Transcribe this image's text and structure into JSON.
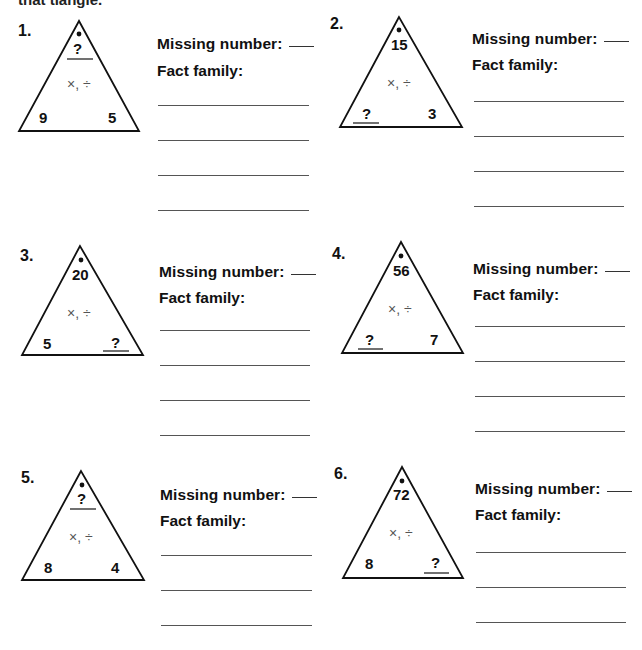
{
  "header": {
    "partial_text": "that tiangle."
  },
  "labels": {
    "missing_number": "Missing number:",
    "fact_family": "Fact family:"
  },
  "operations_symbol": "×, ÷",
  "problems": [
    {
      "number": "1.",
      "top": "?",
      "bottom_left": "9",
      "bottom_right": "5",
      "missing": "top"
    },
    {
      "number": "2.",
      "top": "15",
      "bottom_left": "?",
      "bottom_right": "3",
      "missing": "bottom_left"
    },
    {
      "number": "3.",
      "top": "20",
      "bottom_left": "5",
      "bottom_right": "?",
      "missing": "bottom_right"
    },
    {
      "number": "4.",
      "top": "56",
      "bottom_left": "?",
      "bottom_right": "7",
      "missing": "bottom_left"
    },
    {
      "number": "5.",
      "top": "?",
      "bottom_left": "8",
      "bottom_right": "4",
      "missing": "top"
    },
    {
      "number": "6.",
      "top": "72",
      "bottom_left": "8",
      "bottom_right": "?",
      "missing": "bottom_right"
    }
  ]
}
